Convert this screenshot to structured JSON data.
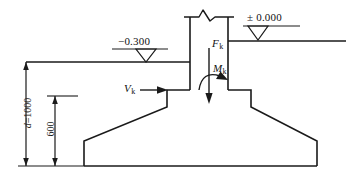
{
  "drawing": {
    "title": "Stepped spread footing foundation section",
    "line_color": "#1a1a1a",
    "background_color": "#ffffff"
  },
  "elevations": [
    {
      "id": "finished-floor",
      "label": "± 0.000",
      "symbol": "elevation-triangle"
    },
    {
      "id": "ground-surface",
      "label": "−0.300",
      "symbol": "elevation-triangle"
    }
  ],
  "loads": [
    {
      "id": "axial-force",
      "base": "F",
      "subscript": "k",
      "symbol": "downward-arrow",
      "description": "vertical characteristic load"
    },
    {
      "id": "moment",
      "base": "M",
      "subscript": "k",
      "symbol": "curved-moment-arrow",
      "description": "characteristic moment"
    },
    {
      "id": "shear-force",
      "base": "V",
      "subscript": "k",
      "symbol": "rightward-arrow",
      "description": "horizontal characteristic load"
    }
  ],
  "dimensions": [
    {
      "id": "embedment-depth",
      "prefix": "d",
      "equals": "=",
      "value": "1000",
      "full_label": "d=1000",
      "orientation": "vertical"
    },
    {
      "id": "footing-height",
      "prefix": "",
      "equals": "",
      "value": "600",
      "full_label": "600",
      "orientation": "vertical"
    }
  ]
}
